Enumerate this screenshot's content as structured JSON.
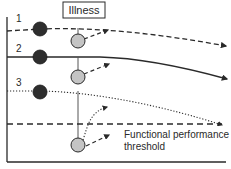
{
  "diagram": {
    "illness_label": "Illness",
    "threshold_label_line1": "Functional performance",
    "threshold_label_line2": "threshold",
    "trajectories": [
      {
        "id": "1",
        "label": "1",
        "style": "dashed"
      },
      {
        "id": "2",
        "label": "2",
        "style": "solid"
      },
      {
        "id": "3",
        "label": "3",
        "style": "dotted"
      }
    ],
    "colors": {
      "line": "#2a2a2a",
      "dark_marker": "#2e2e2e",
      "light_marker": "#c4c4c4",
      "background": "#ffffff"
    }
  }
}
